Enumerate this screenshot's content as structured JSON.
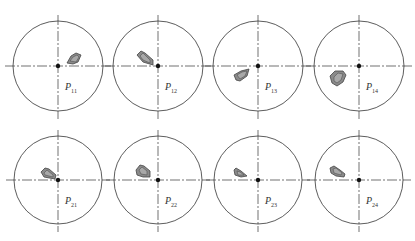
{
  "figure": {
    "colors": {
      "circle_stroke": "#333333",
      "axis_stroke": "#333333",
      "shape_fill": "#8a8a8a",
      "shape_inner": "#a8a8a8",
      "shape_stroke": "#444444",
      "center_dot": "#111111"
    },
    "panels": [
      {
        "label": "P",
        "sub": "11",
        "cx": 58,
        "cy": 66,
        "r": 45,
        "shape": "M67,63 L71,56 L76,53 L81,55 L78,62 L73,64 Z",
        "inner": "M70,61 L73,57 L77,55 L79,57 L76,62 Z"
      },
      {
        "label": "P",
        "sub": "12",
        "cx": 158,
        "cy": 66,
        "r": 45,
        "shape": "M137,55 L141,51 L145,53 L153,60 L153,65 L143,62 Z",
        "inner": "M140,56 L143,53 L150,60 L150,63 L143,60 Z"
      },
      {
        "label": "P",
        "sub": "13",
        "cx": 258,
        "cy": 66,
        "r": 45,
        "shape": "M234,75 L241,71 L249,69 L247,76 L240,81 L236,80 Z",
        "inner": "M237,75 L242,72 L247,71 L245,76 L240,79 Z"
      },
      {
        "label": "P",
        "sub": "14",
        "cx": 359,
        "cy": 66,
        "r": 45,
        "shape": "M330,76 L335,71 L343,71 L346,75 L343,82 L337,86 L332,83 Z",
        "inner": "M334,77 L338,73 L343,74 L341,80 L337,83 L334,81 Z"
      },
      {
        "label": "P",
        "sub": "21",
        "cx": 58,
        "cy": 180,
        "r": 44,
        "shape": "M41,172 L45,168 L49,169 L56,175 L55,179 L44,177 Z",
        "inner": "M44,173 L47,170 L53,175 L53,177 L45,175 Z"
      },
      {
        "label": "P",
        "sub": "22",
        "cx": 158,
        "cy": 180,
        "r": 44,
        "shape": "M136,170 L140,165 L144,166 L150,171 L150,177 L143,177 L137,175 Z",
        "inner": "M139,170 L142,167 L147,171 L147,175 L141,174 Z"
      },
      {
        "label": "P",
        "sub": "23",
        "cx": 258,
        "cy": 180,
        "r": 44,
        "shape": "M234,170 L236,168 L241,171 L247,176 L241,177 L235,175 Z",
        "inner": "M237,171 L240,172 L244,175 L238,175 Z"
      },
      {
        "label": "P",
        "sub": "24",
        "cx": 359,
        "cy": 180,
        "r": 44,
        "shape": "M330,168 L334,166 L340,170 L345,174 L344,177 L336,176 L331,173 Z",
        "inner": "M333,169 L336,168 L342,173 L341,175 L334,173 Z"
      }
    ]
  }
}
